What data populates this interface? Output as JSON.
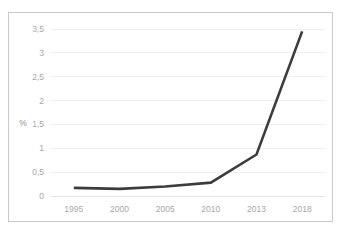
{
  "chart_data": {
    "type": "line",
    "title": "",
    "subtitle": "",
    "xlabel": "",
    "ylabel": "%",
    "categories": [
      "1995",
      "2000",
      "2005",
      "2010",
      "2013",
      "2018"
    ],
    "values": [
      0.17,
      0.15,
      0.2,
      0.28,
      0.87,
      3.45
    ],
    "series": [
      {
        "name": "",
        "values": [
          0.17,
          0.15,
          0.2,
          0.28,
          0.87,
          3.45
        ]
      }
    ],
    "ylim": [
      0,
      3.5
    ],
    "y_ticks": [
      0,
      0.5,
      1,
      1.5,
      2,
      2.5,
      3,
      3.5
    ],
    "y_tick_labels": [
      "0",
      "0,5",
      "1",
      "1,5",
      "2",
      "2,5",
      "3",
      "3,5"
    ],
    "x_tick_labels": [
      "1995",
      "2000",
      "2005",
      "2010",
      "2013",
      "2018"
    ],
    "grid": true,
    "grid_axis": "y",
    "legend": false,
    "legend_position": "none",
    "annotations": [],
    "colors": {
      "line": "#3c3c3c",
      "grid": "#f0f0f0",
      "baseline": "#e6e6e6",
      "tick_text": "#a8a8a8",
      "axis_title_text": "#8f8f8f",
      "border": "#c9c9c9",
      "background": "#ffffff"
    }
  }
}
